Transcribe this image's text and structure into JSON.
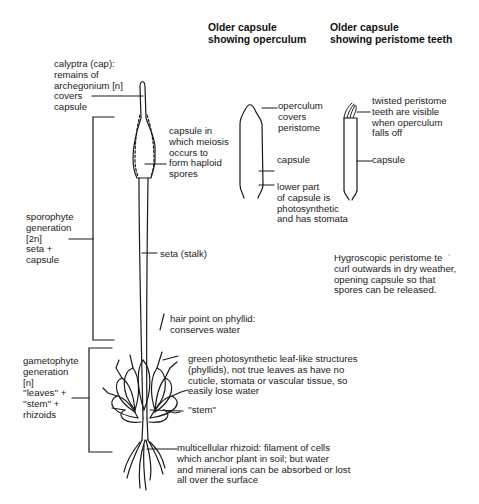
{
  "headings": {
    "operculum_capsule": "Older capsule\nshowing operculum",
    "peristome_capsule": "Older capsule\nshowing peristome teeth"
  },
  "labels": {
    "calyptra": "calyptra (cap):\nremains of\narchegonium [n]\ncovers\ncapsule",
    "capsule_meiosis": "capsule in\nwhich meiosis\noccurs to\nform haploid\nspores",
    "sporophyte": "sporophyte\ngeneration\n[2n]\nseta +\ncapsule",
    "seta": "seta (stalk)",
    "hair_point": "hair point on phyllid:\nconserves water",
    "gametophyte": "gametophyte\ngeneration\n[n]\n''leaves'' +\n''stem'' +\nrhizoids",
    "phyllids": "green photosynthetic leaf-like structures\n(phyllids), not true leaves as have no\ncuticle, stomata or vascular tissue, so\neasily lose water",
    "stem": "''stem''",
    "rhizoid": "multicellular rhizoid: filament of cells\nwhich anchor plant in soil; but water\nand mineral ions can be absorbed or lost\nall over the surface",
    "operculum": "operculum\ncovers\nperistome",
    "capsule_a": "capsule",
    "lower_part": "lower part\nof capsule is\nphotosynthetic\nand has stomata",
    "twisted_peristome": "twisted peristome\nteeth are visible\nwhen operculum\nfalls off",
    "capsule_b": "capsule",
    "hygroscopic": "Hygroscopic peristome te  ʿ\ncurl outwards in dry weather,\nopening capsule so that\nspores can be released."
  }
}
